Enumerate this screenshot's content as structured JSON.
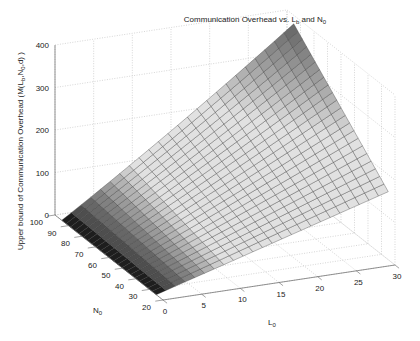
{
  "chart_data": {
    "type": "surface3d",
    "title_parts": {
      "main": "Communication Overhead vs. L",
      "sub1": "b",
      "mid": " and N",
      "sub2": "0"
    },
    "xlabel": "L_0",
    "xlabel_parts": {
      "main": "L",
      "sub": "0"
    },
    "ylabel": "N_0",
    "ylabel_parts": {
      "main": "N",
      "sub": "0"
    },
    "zlabel": "Upper bound of Communication Overhead (M(L_b,N_0,d) )",
    "zlabel_parts": {
      "a": "Upper bound of Communication Overhead (M(L",
      "s1": "b",
      "b": ",N",
      "s2": "0",
      "c": ",d) )"
    },
    "x_ticks": [
      "0",
      "5",
      "10",
      "15",
      "20",
      "25",
      "30"
    ],
    "y_ticks": [
      "20",
      "30",
      "40",
      "50",
      "60",
      "70",
      "80",
      "90",
      "100"
    ],
    "z_ticks": [
      "0",
      "100",
      "200",
      "300",
      "400"
    ],
    "xlim": [
      0,
      30
    ],
    "ylim": [
      20,
      100
    ],
    "zlim": [
      0,
      400
    ],
    "grid": true,
    "colormap": "gray",
    "x_range": [
      0,
      30
    ],
    "y_range": [
      25,
      95
    ],
    "surface_corners": [
      {
        "x": 0,
        "y": 25,
        "z": 0
      },
      {
        "x": 0,
        "y": 95,
        "z": 0
      },
      {
        "x": 30,
        "y": 25,
        "z": 160
      },
      {
        "x": 30,
        "y": 95,
        "z": 380
      }
    ]
  }
}
